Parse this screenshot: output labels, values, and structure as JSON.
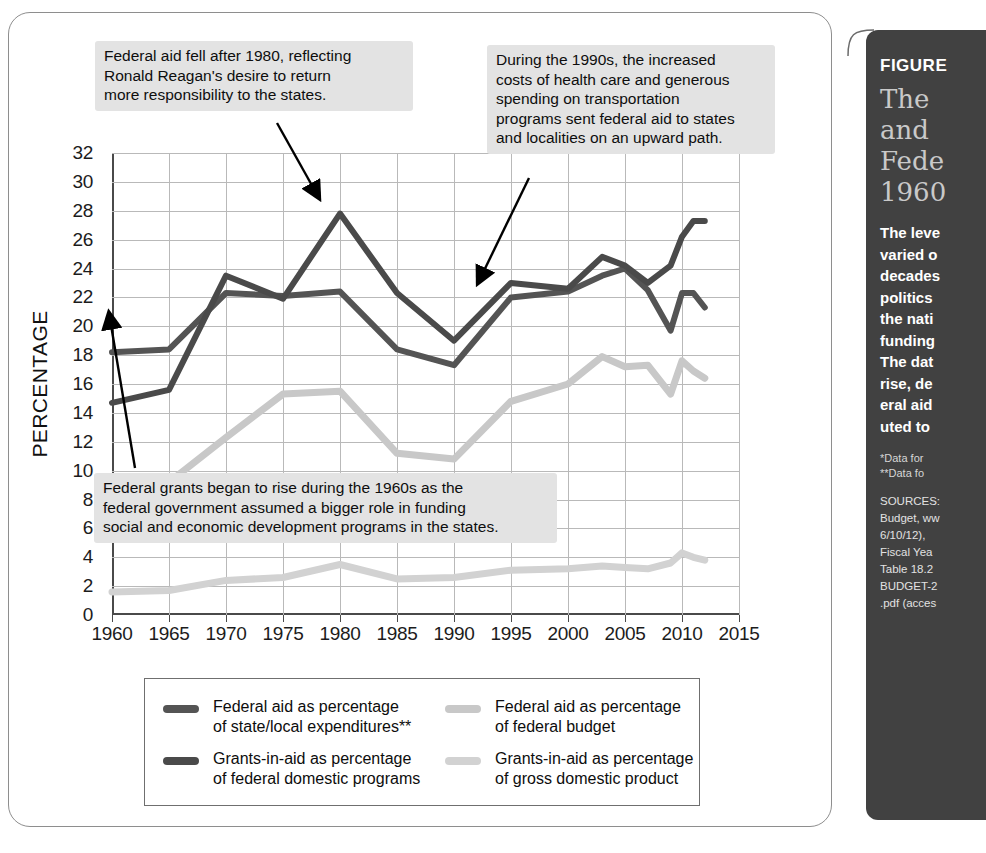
{
  "chart_data": {
    "type": "line",
    "xlabel": "",
    "ylabel": "PERCENTAGE",
    "xlim": [
      1960,
      2015
    ],
    "ylim": [
      0,
      32
    ],
    "grid": true,
    "legend_position": "bottom",
    "x_ticks": [
      "1960",
      "1965",
      "1970",
      "1975",
      "1980",
      "1985",
      "1990",
      "1995",
      "2000",
      "2005",
      "2010",
      "2015"
    ],
    "y_ticks": [
      "0",
      "2",
      "4",
      "6",
      "8",
      "10",
      "12",
      "14",
      "16",
      "18",
      "20",
      "22",
      "24",
      "26",
      "28",
      "30",
      "32"
    ],
    "x": [
      1960,
      1965,
      1970,
      1975,
      1980,
      1985,
      1990,
      1995,
      2000,
      2003,
      2005,
      2007,
      2009,
      2010,
      2011,
      2012
    ],
    "series": [
      {
        "name": "Federal aid as percentage of state/local expenditures**",
        "color": "#545454",
        "values": [
          18.2,
          18.4,
          22.3,
          22.1,
          22.4,
          18.4,
          17.3,
          22.0,
          22.4,
          23.5,
          24.0,
          22.5,
          19.7,
          22.3,
          22.3,
          21.3
        ]
      },
      {
        "name": "Grants-in-aid as percentage of federal domestic programs",
        "color": "#4a4a4a",
        "values": [
          14.7,
          15.6,
          23.5,
          21.9,
          27.8,
          22.3,
          19.0,
          23.0,
          22.6,
          24.8,
          24.2,
          23.0,
          24.2,
          26.2,
          27.3,
          27.3
        ]
      },
      {
        "name": "Federal aid as percentage of federal budget",
        "color": "#c8c8c8",
        "values": [
          7.6,
          9.2,
          12.3,
          15.3,
          15.5,
          11.2,
          10.8,
          14.8,
          16.0,
          17.9,
          17.2,
          17.3,
          15.3,
          17.6,
          16.9,
          16.4
        ]
      },
      {
        "name": "Grants-in-aid as percentage of gross domestic product",
        "color": "#d2d2d2",
        "values": [
          1.6,
          1.7,
          2.4,
          2.6,
          3.5,
          2.5,
          2.6,
          3.1,
          3.2,
          3.4,
          3.3,
          3.2,
          3.6,
          4.3,
          4.0,
          3.8
        ]
      }
    ],
    "annotations": [
      {
        "id": "reagan",
        "text": "Federal aid fell after 1980, reflecting\nRonald Reagan's desire to return\nmore responsibility to the states.",
        "points_to_year": 1980
      },
      {
        "id": "nineties",
        "text": "During the 1990s, the increased\ncosts of health care and generous\nspending on transportation\nprograms sent federal aid to states\nand localities on an upward path.",
        "points_to_year": 1993
      },
      {
        "id": "sixties",
        "text": "Federal grants began to rise during the 1960s as the\nfederal  government assumed a bigger role in funding\nsocial and economic development programs in the states.",
        "points_to_year": 1965
      }
    ]
  },
  "legend": {
    "items": [
      {
        "label": "Federal aid as percentage\nof state/local expenditures**",
        "color": "#545454"
      },
      {
        "label": "Federal aid as percentage\nof federal budget",
        "color": "#c8c8c8"
      },
      {
        "label": "Grants-in-aid as percentage\nof federal domestic programs",
        "color": "#4a4a4a"
      },
      {
        "label": "Grants-in-aid as percentage\nof gross domestic product",
        "color": "#d2d2d2"
      }
    ]
  },
  "sidebar": {
    "figure_label": "FIGURE",
    "title": "The\nand\nFede\n1960",
    "body": "The leve\nvaried o\ndecades\npolitics\nthe nati\nfunding\nThe dat\nrise, de\neral aid\nuted to",
    "note_1": "*Data for",
    "note_2": "**Data fo",
    "sources": "SOURCES:\nBudget, ww\n6/10/12),\nFiscal Yea\nTable 18.2\nBUDGET-2\n.pdf (acces"
  }
}
